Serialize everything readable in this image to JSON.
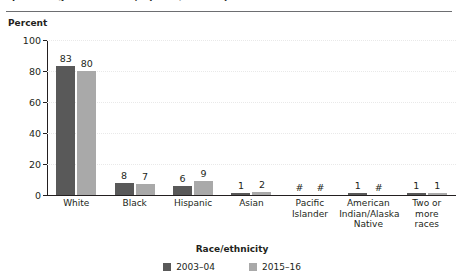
{
  "figure": {
    "clipped_caption": "percentage distribution, by race/ethnicity",
    "y_axis_title": "Percent",
    "x_axis_title": "Race/ethnicity"
  },
  "legend": {
    "items": [
      {
        "label": "2003–04",
        "color": "#595959",
        "swatch_icon": "square-swatch-icon"
      },
      {
        "label": "2015–16",
        "color": "#a9a9a9",
        "swatch_icon": "square-swatch-icon"
      }
    ]
  },
  "chart_data": {
    "type": "bar",
    "title": "",
    "xlabel": "Race/ethnicity",
    "ylabel": "Percent",
    "ylim": [
      0,
      100
    ],
    "yticks": [
      0,
      20,
      40,
      60,
      80,
      100
    ],
    "grid": true,
    "legend_position": "bottom",
    "categories": [
      "White",
      "Black",
      "Hispanic",
      "Asian",
      "Pacific Islander",
      "American Indian/Alaska Native",
      "Two or more races"
    ],
    "category_lines": [
      [
        "White"
      ],
      [
        "Black"
      ],
      [
        "Hispanic"
      ],
      [
        "Asian"
      ],
      [
        "Pacific",
        "Islander"
      ],
      [
        "American",
        "Indian/Alaska",
        "Native"
      ],
      [
        "Two or",
        "more",
        "races"
      ]
    ],
    "series": [
      {
        "name": "2003–04",
        "color": "#595959",
        "values": [
          83,
          8,
          6,
          1,
          null,
          1,
          1
        ],
        "labels": [
          "83",
          "8",
          "6",
          "1",
          "#",
          "1",
          "1"
        ]
      },
      {
        "name": "2015–16",
        "color": "#a9a9a9",
        "values": [
          80,
          7,
          9,
          2,
          null,
          null,
          1
        ],
        "labels": [
          "80",
          "7",
          "9",
          "2",
          "#",
          "#",
          "1"
        ]
      }
    ],
    "annotations": {
      "hash_symbol_meaning": "#"
    }
  }
}
